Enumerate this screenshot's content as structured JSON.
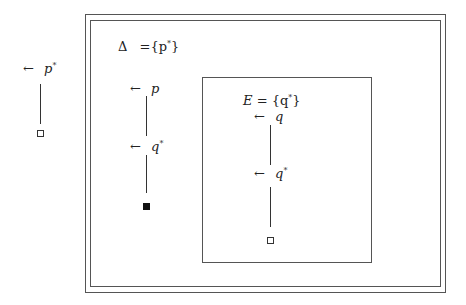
{
  "left_chain": {
    "top_label": {
      "arrow": "←",
      "var": "p",
      "sup": "*"
    },
    "leaf": "hollow-square"
  },
  "outer_box": {
    "title": {
      "symbol": "Δ",
      "rest": "={p",
      "sup": "*",
      "close": "}"
    },
    "chain": {
      "labels": [
        {
          "arrow": "←",
          "var": "p",
          "sup": ""
        },
        {
          "arrow": "←",
          "var": "q",
          "sup": "*"
        }
      ],
      "leaf": "filled-square"
    }
  },
  "inner_box": {
    "title": {
      "var": "E",
      "rest": " = {q",
      "sup": "*",
      "close": "}"
    },
    "chain": {
      "labels": [
        {
          "arrow": "←",
          "var": "q",
          "sup": ""
        },
        {
          "arrow": "←",
          "var": "q",
          "sup": "*"
        }
      ],
      "leaf": "hollow-square"
    }
  },
  "colors": {
    "line": "#555555",
    "background": "#ffffff"
  }
}
